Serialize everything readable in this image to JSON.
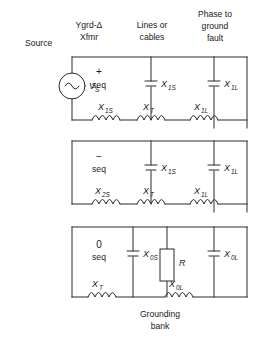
{
  "headers": [
    {
      "name": "source",
      "lines": [
        "Source"
      ]
    },
    {
      "name": "transformer",
      "lines": [
        "Ygrd-Δ",
        "Xfmr"
      ]
    },
    {
      "name": "lines-cables",
      "lines": [
        "Lines or",
        "cables"
      ]
    },
    {
      "name": "fault",
      "lines": [
        "Phase to",
        "ground",
        "fault"
      ]
    }
  ],
  "rows": [
    {
      "name": "positive-sequence",
      "sign": "+",
      "seq_label": "seq",
      "source_label": "V",
      "source_sub": "S",
      "series": [
        {
          "name": "source-reactance",
          "sym": "X",
          "sub": "1S"
        },
        {
          "name": "transformer-reactance",
          "sym": "X",
          "sub": "T"
        },
        {
          "name": "line-reactance",
          "sym": "X",
          "sub": "1L"
        }
      ],
      "shunts": [
        {
          "name": "line-charging-source-side",
          "sym": "X",
          "sub": "1S"
        },
        {
          "name": "line-charging-load-side",
          "sym": "X",
          "sub": "1L"
        }
      ]
    },
    {
      "name": "negative-sequence",
      "sign": "−",
      "seq_label": "seq",
      "series": [
        {
          "name": "source-reactance",
          "sym": "X",
          "sub": "2S"
        },
        {
          "name": "transformer-reactance",
          "sym": "X",
          "sub": "T"
        },
        {
          "name": "line-reactance",
          "sym": "X",
          "sub": "1L"
        }
      ],
      "shunts": [
        {
          "name": "line-charging-source-side",
          "sym": "X",
          "sub": "1S"
        },
        {
          "name": "line-charging-load-side",
          "sym": "X",
          "sub": "1L"
        }
      ]
    },
    {
      "name": "zero-sequence",
      "sign": "0",
      "seq_label": "seq",
      "series": [
        {
          "name": "transformer-reactance",
          "sym": "X",
          "sub": "T"
        },
        {
          "name": "line-reactance",
          "sym": "X",
          "sub": "0L"
        }
      ],
      "shunts": [
        {
          "name": "line-charging-source-side",
          "sym": "X",
          "sub": "0S"
        },
        {
          "name": "line-charging-load-side",
          "sym": "X",
          "sub": "0L"
        }
      ],
      "resistor": {
        "name": "grounding-resistor",
        "sym": "R"
      }
    }
  ],
  "caption": {
    "name": "grounding-bank",
    "lines": [
      "Grounding",
      "bank"
    ]
  },
  "colors": {
    "line": "#2b2b2b",
    "text": "#1a1a1a",
    "background": "#ffffff"
  }
}
